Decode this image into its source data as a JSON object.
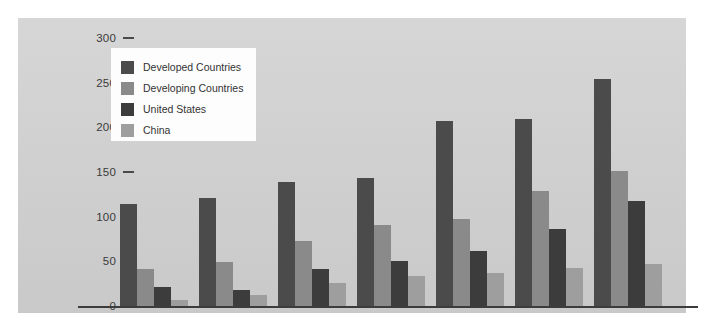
{
  "chart_data": {
    "type": "bar",
    "title": "",
    "xlabel": "",
    "ylabel": "",
    "categories": [
      "1991",
      "1992",
      "1993",
      "1994",
      "1995",
      "1996",
      "1997"
    ],
    "ylim": [
      0,
      300
    ],
    "yticks": [
      0,
      50,
      100,
      150,
      200,
      250,
      300
    ],
    "ytick_labels": [
      "0",
      "50",
      "100",
      "150",
      "200",
      "250",
      "300"
    ],
    "grid": false,
    "legend_position": "upper-left",
    "series": [
      {
        "name": "Developed Countries",
        "color": "#4b4b4b",
        "values": [
          115,
          122,
          140,
          144,
          208,
          211,
          255
        ]
      },
      {
        "name": "Developing Countries",
        "color": "#8a8a8a",
        "values": [
          42,
          50,
          74,
          92,
          98,
          130,
          152
        ]
      },
      {
        "name": "United States",
        "color": "#3c3c3c",
        "values": [
          22,
          19,
          43,
          51,
          63,
          87,
          119
        ]
      },
      {
        "name": "China",
        "color": "#9e9e9e",
        "values": [
          8,
          13,
          27,
          35,
          38,
          44,
          48
        ]
      }
    ],
    "panel_background": "#d2d2d2",
    "legend_background": "#fdfdfd",
    "axis_color": "#3c3c3c"
  }
}
